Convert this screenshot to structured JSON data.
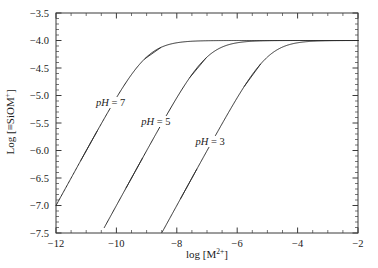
{
  "chart_data": {
    "type": "line",
    "title": "",
    "subtitle": "",
    "xlabel": "log [M2+]",
    "xlabel_parts": {
      "base": "log [M",
      "sup": "2+",
      "tail": "]"
    },
    "ylabel": "Log [=SiOM+]",
    "ylabel_parts": {
      "base": "Log [≡SiOM",
      "sup": "+",
      "tail": "]"
    },
    "xlim": [
      -12,
      -2
    ],
    "ylim": [
      -7.5,
      -3.5
    ],
    "x_major_ticks": [
      -12,
      -10,
      -8,
      -6,
      -4,
      -2
    ],
    "x_major_tick_labels": [
      "−12",
      "−10",
      "−8",
      "−6",
      "−4",
      "−2"
    ],
    "x_minor_tick_step": 0.5,
    "y_major_ticks": [
      -7.5,
      -7.0,
      -6.5,
      -6.0,
      -5.5,
      -5.0,
      -4.5,
      -4.0,
      -3.5
    ],
    "y_major_tick_labels": [
      "−7.5",
      "−7.0",
      "−6.5",
      "−6.0",
      "−5.5",
      "−5.0",
      "−4.5",
      "−4.0",
      "−3.5"
    ],
    "y_minor_tick_step": 0.1,
    "grid": false,
    "legend_position": "inline-annotations",
    "saturation_level": -4.0,
    "series": [
      {
        "name": "pH = 7",
        "label_italic_prefix": "pH",
        "label_rest": " = 7",
        "half_saturation_x": -9.0,
        "onset_x": -12.0,
        "x": [
          -12.0,
          -11.5,
          -11.0,
          -10.5,
          -10.0,
          -9.5,
          -9.0,
          -8.5,
          -8.0,
          -7.5,
          -7.0,
          -6.5,
          -6.0,
          -5.5,
          -5.0,
          -4.5,
          -4.0,
          -3.5,
          -3.0,
          -2.5,
          -2.0
        ],
        "y": [
          -7.0,
          -6.5,
          -6.0,
          -5.5,
          -5.01,
          -4.53,
          -4.3,
          -4.12,
          -4.05,
          -4.02,
          -4.01,
          -4.004,
          -4.001,
          -4.0,
          -4.0,
          -4.0,
          -4.0,
          -4.0,
          -4.0,
          -4.0,
          -4.0
        ]
      },
      {
        "name": "pH = 5",
        "label_italic_prefix": "pH",
        "label_rest": " = 5",
        "half_saturation_x": -7.0,
        "onset_x": -10.4,
        "x": [
          -10.4,
          -10.0,
          -9.5,
          -9.0,
          -8.5,
          -8.0,
          -7.5,
          -7.0,
          -6.5,
          -6.0,
          -5.5,
          -5.0,
          -4.5,
          -4.0,
          -3.5,
          -3.0,
          -2.5,
          -2.0
        ],
        "y": [
          -7.4,
          -7.0,
          -6.5,
          -6.0,
          -5.5,
          -5.01,
          -4.53,
          -4.3,
          -4.12,
          -4.05,
          -4.02,
          -4.01,
          -4.004,
          -4.001,
          -4.0,
          -4.0,
          -4.0,
          -4.0
        ]
      },
      {
        "name": "pH = 3",
        "label_italic_prefix": "pH",
        "label_rest": " = 3",
        "half_saturation_x": -5.0,
        "onset_x": -8.5,
        "x": [
          -8.5,
          -8.0,
          -7.5,
          -7.0,
          -6.5,
          -6.0,
          -5.5,
          -5.0,
          -4.5,
          -4.0,
          -3.5,
          -3.0,
          -2.5,
          -2.0
        ],
        "y": [
          -7.5,
          -7.0,
          -6.5,
          -6.0,
          -5.5,
          -5.01,
          -4.53,
          -4.3,
          -4.12,
          -4.05,
          -4.02,
          -4.01,
          -4.004,
          -4.001
        ]
      }
    ],
    "annotations": [
      {
        "text": "pH = 7",
        "x": -9.85,
        "y": -5.15
      },
      {
        "text": "pH = 5",
        "x": -8.35,
        "y": -5.5
      },
      {
        "text": "pH = 3",
        "x": -6.55,
        "y": -5.87
      }
    ]
  },
  "figure": {
    "background_color": "#ffffff",
    "curve_color": "#2b2b2b",
    "axis_color": "#3a3a3a",
    "text_color": "#1a1a1a"
  }
}
